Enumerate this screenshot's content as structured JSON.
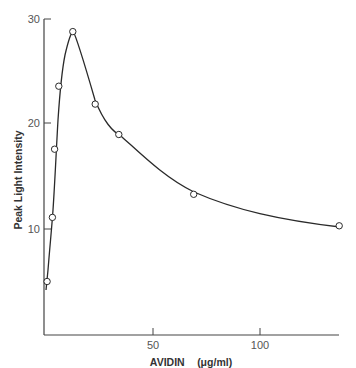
{
  "chart_data": {
    "type": "scatter",
    "title": "",
    "xlabel": "AVIDIN",
    "xlabel_unit": "(μg/ml)",
    "ylabel": "Peak Light Intensity",
    "xlim": [
      0,
      137
    ],
    "ylim": [
      0,
      30
    ],
    "x_ticks": [
      50,
      100
    ],
    "y_ticks": [
      10,
      20,
      30
    ],
    "grid": false,
    "legend": null,
    "series": [
      {
        "name": "Peak Light Intensity",
        "marker": "open-circle",
        "fitted_curve": true,
        "points": [
          {
            "x": 0.5,
            "y": 5.0
          },
          {
            "x": 3,
            "y": 11.1
          },
          {
            "x": 4,
            "y": 17.6
          },
          {
            "x": 6,
            "y": 23.6
          },
          {
            "x": 12.5,
            "y": 28.8
          },
          {
            "x": 23,
            "y": 21.9
          },
          {
            "x": 34,
            "y": 19.0
          },
          {
            "x": 69,
            "y": 13.3
          },
          {
            "x": 137,
            "y": 10.3
          }
        ]
      }
    ]
  },
  "labels": {
    "y_axis_title": "Peak Light Intensity",
    "x_axis_title": "AVIDIN",
    "x_axis_unit": "(μg/ml)",
    "y_tick_10": "10",
    "y_tick_20": "20",
    "y_tick_30": "30",
    "x_tick_50": "50",
    "x_tick_100": "100"
  },
  "colors": {
    "line": "#2a2a2a",
    "marker_fill": "#ffffff",
    "axis": "#444444"
  }
}
